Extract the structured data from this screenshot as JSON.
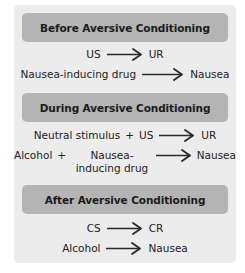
{
  "sections": [
    {
      "title": "Before Aversive Conditioning",
      "rows": [
        {
          "left": "US",
          "right": "UR"
        },
        {
          "left": "Nausea-inducing drug",
          "right": "Nausea"
        }
      ]
    },
    {
      "title": "During Aversive Conditioning",
      "rows": [
        {
          "left_a": "Neutral stimulus",
          "plus": "+",
          "left_b": "US",
          "right": "UR"
        },
        {
          "left_a": "Alcohol",
          "plus": "+",
          "left_b": "Nausea-inducing drug",
          "right": "Nausea"
        }
      ]
    },
    {
      "title": "After Aversive Conditioning",
      "rows": [
        {
          "left": "CS",
          "right": "CR"
        },
        {
          "left": "Alcohol",
          "right": "Nausea"
        }
      ]
    }
  ],
  "colors": {
    "panel_bg": "#ececec",
    "header_bg": "#b4b4b4",
    "text": "#222222",
    "arrow": "#2a2a2a"
  }
}
